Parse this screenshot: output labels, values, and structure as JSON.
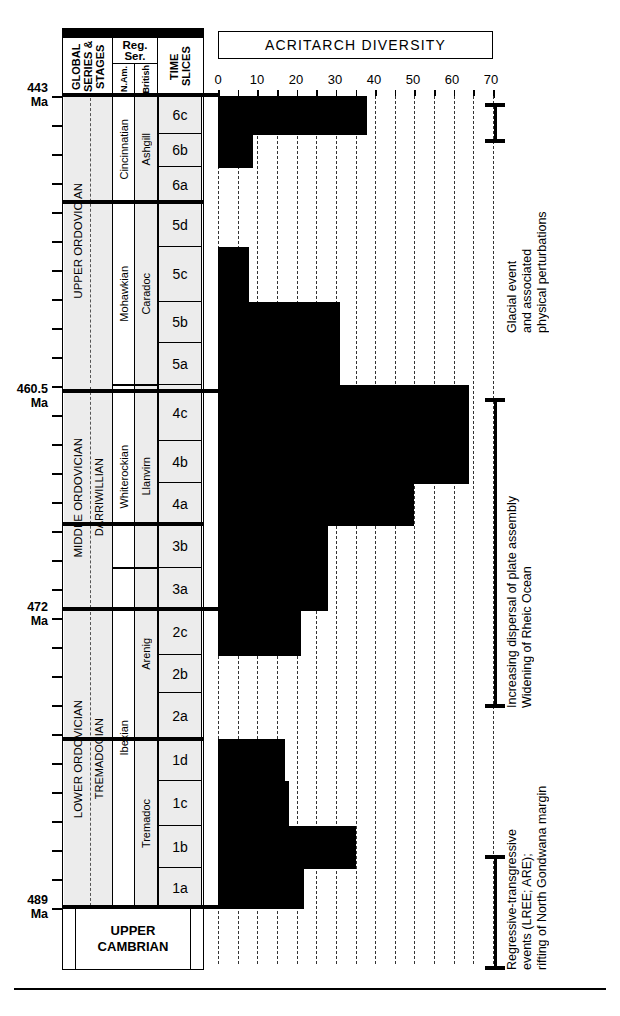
{
  "chart_data": {
    "type": "bar",
    "title": "ACRITARCH DIVERSITY",
    "xlabel": "",
    "ylabel": "TIME SLICES",
    "xlim": [
      0,
      70
    ],
    "xticks": [
      0,
      10,
      20,
      30,
      40,
      50,
      60,
      70
    ],
    "grid": true,
    "orientation": "horizontal",
    "categories": [
      "6c",
      "6b",
      "6a",
      "5d",
      "5c",
      "5b",
      "5a",
      "4c",
      "4b",
      "4a",
      "3b",
      "3a",
      "2c",
      "2b",
      "2a",
      "1d",
      "1c",
      "1b",
      "1a"
    ],
    "values": [
      38,
      9,
      0,
      0,
      8,
      31,
      31,
      64,
      64,
      50,
      28,
      28,
      21,
      0,
      0,
      17,
      18,
      35,
      22
    ],
    "note": "Horizontal step-bars of acritarch species diversity per Ordovician time slice, youngest (6c) at top."
  },
  "columns": {
    "global_header": "GLOBAL SERIES & STAGES",
    "regser_header": "Reg. Ser.",
    "nam_header": "N.Am.",
    "british_header": "British",
    "timeslices_header": "TIME SLICES"
  },
  "global_series": [
    {
      "name": "UPPER ORDOVICIAN",
      "stage": ""
    },
    {
      "name": "MIDDLE ORDOVICIAN",
      "stage": "DARRIWILLIAN"
    },
    {
      "name": "LOWER ORDOVICIAN",
      "stage": "TREMADOCIAN"
    }
  ],
  "nam_series": [
    "Cincinnatian",
    "Mohawkian",
    "Whiterockian",
    "Ibexian"
  ],
  "british_series": [
    "Ashgill",
    "Caradoc",
    "Llanvirn",
    "Arenig",
    "Tremadoc"
  ],
  "time_slices": [
    "6c",
    "6b",
    "6a",
    "5d",
    "5c",
    "5b",
    "5a",
    "4c",
    "4b",
    "4a",
    "3b",
    "3a",
    "2c",
    "2b",
    "2a",
    "1d",
    "1c",
    "1b",
    "1a"
  ],
  "ages": [
    {
      "value": "443",
      "unit": "Ma"
    },
    {
      "value": "460.5",
      "unit": "Ma"
    },
    {
      "value": "472",
      "unit": "Ma"
    },
    {
      "value": "489",
      "unit": "Ma"
    }
  ],
  "footer": {
    "line1": "UPPER",
    "line2": "CAMBRIAN"
  },
  "annotations": [
    {
      "id": "glacial",
      "line1": "Glacial event",
      "line2": "and associated",
      "line3": "physical perturbations"
    },
    {
      "id": "dispersal",
      "line1": "Increasing dispersal of plate assembly",
      "line2": "Widening of Rheic Ocean",
      "line3": ""
    },
    {
      "id": "regressive",
      "line1": "Regressive-transgressive",
      "line2": "events (LREE; ARE);",
      "line3": "rifting of North Gondwana margin"
    }
  ],
  "colors": {
    "bar": "#000000",
    "shade": "#ececec",
    "ink": "#000000",
    "paper": "#ffffff"
  }
}
